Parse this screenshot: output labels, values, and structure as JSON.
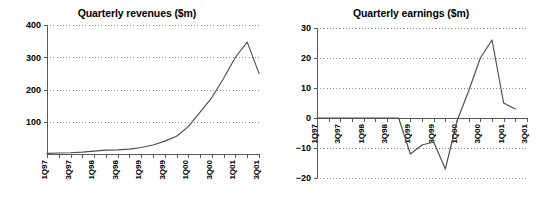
{
  "chart_data": [
    {
      "type": "line",
      "id": "quarterly-revenues",
      "title": "Quarterly revenues ($m)",
      "xlabel": "",
      "ylabel": "",
      "ylim": [
        0,
        400
      ],
      "yticks": [
        0,
        100,
        200,
        300,
        400
      ],
      "ytick_labels": [
        "",
        "100",
        "200",
        "300",
        "400"
      ],
      "grid": true,
      "legend": "none",
      "x": [
        "1Q97",
        "2Q97",
        "3Q97",
        "4Q97",
        "1Q98",
        "2Q98",
        "3Q98",
        "4Q98",
        "1Q99",
        "2Q99",
        "3Q99",
        "4Q99",
        "1Q00",
        "2Q00",
        "3Q00",
        "4Q00",
        "1Q01",
        "2Q01",
        "3Q01"
      ],
      "xtick_labels": [
        "1Q97",
        "",
        "3Q97",
        "",
        "1Q98",
        "",
        "3Q98",
        "",
        "1Q99",
        "",
        "3Q99",
        "",
        "1Q00",
        "",
        "3Q00",
        "",
        "1Q01",
        "",
        "3Q01"
      ],
      "values": [
        2,
        3,
        4,
        6,
        9,
        12,
        13,
        15,
        20,
        28,
        40,
        55,
        85,
        130,
        175,
        235,
        300,
        347,
        250
      ],
      "series_name": "Quarterly revenues"
    },
    {
      "type": "line",
      "id": "quarterly-earnings",
      "title": "Quarterly earnings ($m)",
      "xlabel": "",
      "ylabel": "",
      "ylim": [
        -20,
        30
      ],
      "yticks": [
        -20,
        -10,
        0,
        10,
        20,
        30
      ],
      "ytick_labels": [
        "−20",
        "−10",
        "0",
        "10",
        "20",
        "30"
      ],
      "grid": true,
      "legend": "none",
      "x": [
        "1Q97",
        "2Q97",
        "3Q97",
        "4Q97",
        "1Q98",
        "2Q98",
        "3Q98",
        "4Q98",
        "1Q99",
        "2Q99",
        "3Q99",
        "4Q99",
        "1Q00",
        "2Q00",
        "3Q00",
        "4Q00",
        "1Q01",
        "2Q01",
        "3Q01"
      ],
      "xtick_labels": [
        "1Q97",
        "",
        "3Q97",
        "",
        "1Q98",
        "",
        "3Q98",
        "",
        "1Q99",
        "",
        "3Q99",
        "",
        "1Q00",
        "",
        "3Q00",
        "",
        "1Q01",
        "",
        "3Q01"
      ],
      "values": [
        0,
        0,
        0,
        0,
        0,
        0,
        0,
        0,
        -12,
        -9,
        -8,
        -17,
        -1,
        9,
        20,
        26,
        5,
        3,
        null
      ],
      "series_name": "Quarterly earnings"
    }
  ]
}
